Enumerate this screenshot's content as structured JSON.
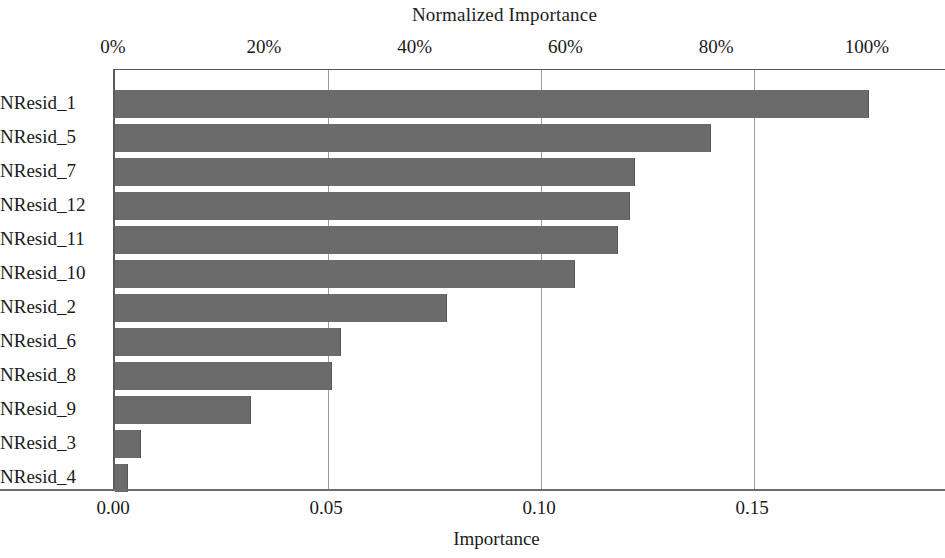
{
  "chart_data": {
    "type": "bar",
    "orientation": "horizontal",
    "title": "Normalized Importance",
    "xlabel": "Importance",
    "ylabel": "",
    "categories": [
      "NResid_1",
      "NResid_5",
      "NResid_7",
      "NResid_12",
      "NResid_11",
      "NResid_10",
      "NResid_2",
      "NResid_6",
      "NResid_8",
      "NResid_9",
      "NResid_3",
      "NResid_4"
    ],
    "values": [
      0.177,
      0.14,
      0.122,
      0.121,
      0.118,
      0.108,
      0.078,
      0.053,
      0.051,
      0.032,
      0.006,
      0.003
    ],
    "normalized_values": [
      100,
      79.1,
      68.8,
      68.4,
      66.6,
      61.0,
      44.1,
      29.9,
      28.8,
      18.1,
      3.4,
      1.7
    ],
    "xlim": [
      0.0,
      0.1953
    ],
    "bottom_axis": {
      "label": "Importance",
      "ticks": [
        0.0,
        0.05,
        0.1,
        0.15
      ],
      "tick_labels": [
        "0.00",
        "0.05",
        "0.10",
        "0.15"
      ]
    },
    "top_axis": {
      "label": "Normalized Importance",
      "ticks": [
        0,
        20,
        40,
        60,
        80,
        100
      ],
      "tick_labels": [
        "0%",
        "20%",
        "40%",
        "60%",
        "80%",
        "100%"
      ]
    },
    "grid": true,
    "gridlines_at": [
      0.05,
      0.1,
      0.15
    ],
    "legend": null,
    "bar_color": "#6b6b6b",
    "axis_color": "#5a5a5a",
    "grid_color": "#9a9a9a",
    "background": "#ffffff"
  }
}
